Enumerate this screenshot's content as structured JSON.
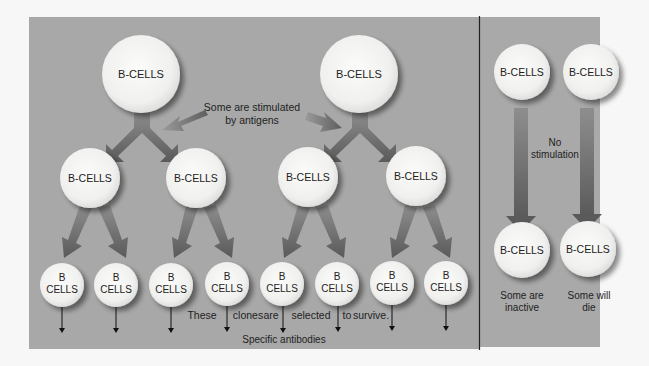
{
  "diagram": {
    "colors": {
      "page_bg": "#f7f7f7",
      "panel_bg": "#a8a8a8",
      "circle_fill": "#f3f3f1",
      "arrow_dark": "#5e5e5e",
      "arrow_light": "#8c8c8c",
      "text": "#222222",
      "divider": "#222222"
    },
    "left_panel": {
      "top_cells": [
        {
          "label": "B-CELLS"
        },
        {
          "label": "B-CELLS"
        }
      ],
      "annotation_stimulated": {
        "line1": "Some are stimulated",
        "line2": "by antigens"
      },
      "middle_cells": [
        {
          "label": "B-CELLS"
        },
        {
          "label": "B-CELLS"
        },
        {
          "label": "B-CELLS"
        },
        {
          "label": "B-CELLS"
        }
      ],
      "bottom_cells": [
        {
          "line1": "B",
          "line2": "CELLS"
        },
        {
          "line1": "B",
          "line2": "CELLS"
        },
        {
          "line1": "B",
          "line2": "CELLS"
        },
        {
          "line1": "B",
          "line2": "CELLS"
        },
        {
          "line1": "B",
          "line2": "CELLS"
        },
        {
          "line1": "B",
          "line2": "CELLS"
        },
        {
          "line1": "B",
          "line2": "CELLS"
        },
        {
          "line1": "B",
          "line2": "CELLS"
        }
      ],
      "selection_caption": {
        "w1": "These",
        "w2": "clones",
        "w3": "are",
        "w4": "selected",
        "w5": "to",
        "w6": "survive."
      },
      "antibodies_caption": "Specific antibodies"
    },
    "right_panel": {
      "top_cells": [
        {
          "label": "B-CELLS"
        },
        {
          "label": "B-CELLS"
        }
      ],
      "annotation_no_stim": {
        "line1": "No",
        "line2": "stimulation"
      },
      "bottom_cells": [
        {
          "label": "B-CELLS",
          "caption1": "Some are",
          "caption2": "inactive"
        },
        {
          "label": "B-CELLS",
          "caption1": "Some will",
          "caption2": "die"
        }
      ]
    }
  }
}
